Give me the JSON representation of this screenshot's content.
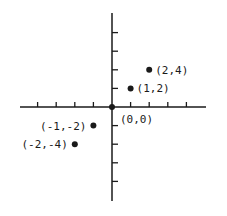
{
  "chart_data": {
    "type": "scatter",
    "title": "",
    "xlabel": "",
    "ylabel": "",
    "grid": false,
    "legend": null,
    "xlim": [
      -5,
      5
    ],
    "ylim": [
      -5,
      5
    ],
    "x_ticks": [
      -4,
      -3,
      -2,
      -1,
      1,
      2,
      3,
      4
    ],
    "y_ticks": [
      -4,
      -3,
      -2,
      -1,
      1,
      2,
      3,
      4
    ],
    "tick_units": {
      "x_per_tick": 1,
      "y_per_tick": 2
    },
    "points": [
      {
        "x": 2,
        "y": 4,
        "label": "(2,4)"
      },
      {
        "x": 1,
        "y": 2,
        "label": "(1,2)"
      },
      {
        "x": 0,
        "y": 0,
        "label": "(0,0)"
      },
      {
        "x": -1,
        "y": -2,
        "label": "(-1,-2)"
      },
      {
        "x": -2,
        "y": -4,
        "label": "(-2,-4)"
      }
    ]
  },
  "colors": {
    "ink": "#1a1a1a",
    "background": "#ffffff"
  }
}
